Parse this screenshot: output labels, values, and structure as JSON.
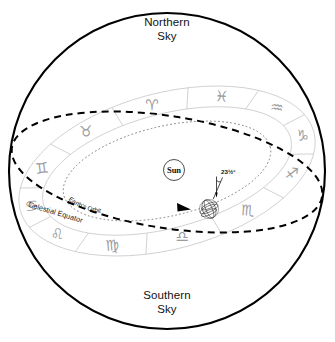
{
  "diagram": {
    "sphere": {
      "north_label_line1": "Northern",
      "north_label_line2": "Sky",
      "south_label_line1": "Southern",
      "south_label_line2": "Sky"
    },
    "center_objects": {
      "sun_label": "Sun",
      "earth_name": "Earth",
      "tilt_label": "23½°"
    },
    "curves": [
      {
        "id": "celestial-equator",
        "label": "Celestial Equator",
        "style": "dashed",
        "color": "#000000"
      },
      {
        "id": "earths-orbit",
        "label": "Earth's Orbit",
        "style": "dotted",
        "color": "#7a7a80"
      },
      {
        "id": "zodiac-band",
        "label": "Zodiac Band",
        "style": "solid-ring",
        "color": "#b9b9bf"
      }
    ],
    "zodiac": {
      "count": 12,
      "signs": [
        {
          "name": "Gemini",
          "glyph": "♊"
        },
        {
          "name": "Taurus",
          "glyph": "♉"
        },
        {
          "name": "Aries",
          "glyph": "♈"
        },
        {
          "name": "Pisces",
          "glyph": "♓"
        },
        {
          "name": "Aquarius",
          "glyph": "♒"
        },
        {
          "name": "Capricorn",
          "glyph": "♑"
        },
        {
          "name": "Sagittarius",
          "glyph": "♐"
        },
        {
          "name": "Scorpio",
          "glyph": "♏"
        },
        {
          "name": "Libra",
          "glyph": "♎"
        },
        {
          "name": "Virgo",
          "glyph": "♍"
        },
        {
          "name": "Leo",
          "glyph": "♌"
        },
        {
          "name": "Cancer",
          "glyph": "♋"
        }
      ]
    },
    "colors": {
      "outline": "#000000",
      "band": "#b9b9bf",
      "glyph": "#9a9aa0",
      "orbit": "#7a7a80",
      "background": "#ffffff"
    }
  }
}
